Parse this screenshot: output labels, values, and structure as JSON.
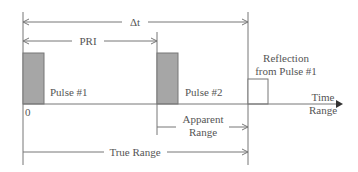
{
  "diagram": {
    "labels": {
      "delta_t": "Δt",
      "pri": "PRI",
      "pulse1": "Pulse #1",
      "pulse2": "Pulse #2",
      "reflection_line1": "Reflection",
      "reflection_line2": "from Pulse #1",
      "origin": "0",
      "axis_line1": "Time",
      "axis_line2": "Range",
      "apparent_line1": "Apparent",
      "apparent_line2": "Range",
      "true_range": "True Range"
    },
    "colors": {
      "pulse_fill": "#a6a6a6",
      "line": "#777777",
      "text": "#555555",
      "axis_arrow": "#333333"
    }
  }
}
